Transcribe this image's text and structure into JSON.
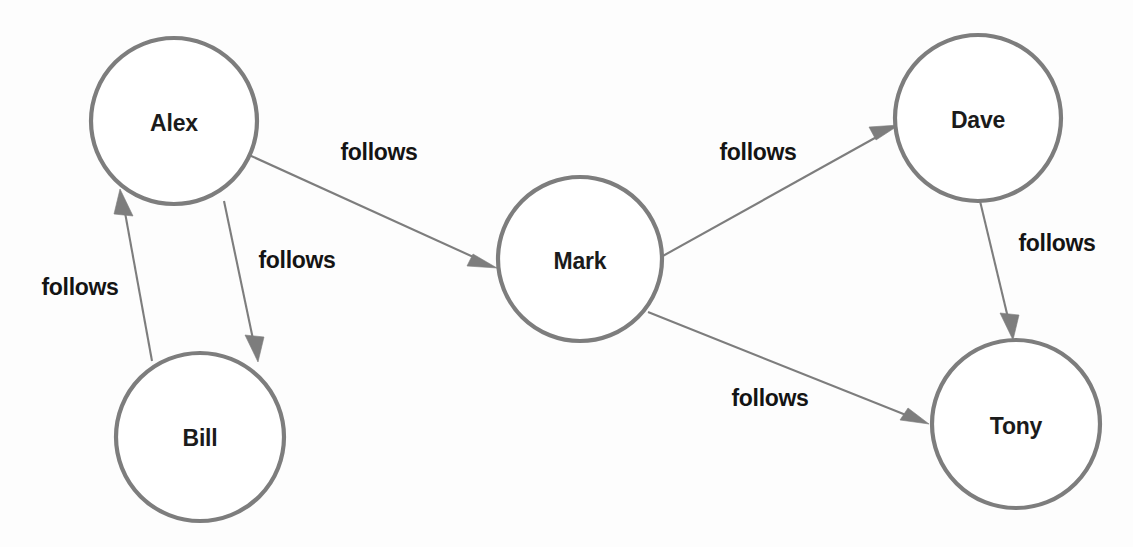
{
  "diagram": {
    "type": "directed-graph",
    "width": 1133,
    "height": 547,
    "background_color": "#fdfdfd",
    "node_stroke_color": "#7d7d7d",
    "node_fill_color": "#ffffff",
    "edge_stroke_color": "#7d7d7d",
    "label_color": "#141414",
    "nodes": [
      {
        "id": "alex",
        "label": "Alex",
        "cx": 174,
        "cy": 121,
        "r": 83
      },
      {
        "id": "bill",
        "label": "Bill",
        "cx": 200,
        "cy": 437,
        "r": 84
      },
      {
        "id": "mark",
        "label": "Mark",
        "cx": 580,
        "cy": 259,
        "r": 82
      },
      {
        "id": "dave",
        "label": "Dave",
        "cx": 978,
        "cy": 118,
        "r": 83
      },
      {
        "id": "tony",
        "label": "Tony",
        "cx": 1016,
        "cy": 424,
        "r": 84
      }
    ],
    "edges": [
      {
        "id": "alex-mark",
        "source": "alex",
        "target": "mark",
        "label": "follows",
        "x1": 249,
        "y1": 155,
        "x2": 497,
        "y2": 268,
        "label_x": 379,
        "label_y": 152
      },
      {
        "id": "alex-bill",
        "source": "alex",
        "target": "bill",
        "label": "follows",
        "x1": 224,
        "y1": 201,
        "x2": 258,
        "y2": 360,
        "label_x": 297,
        "label_y": 260
      },
      {
        "id": "bill-alex",
        "source": "bill",
        "target": "alex",
        "label": "follows",
        "x1": 152,
        "y1": 361,
        "x2": 120,
        "y2": 189,
        "label_x": 80,
        "label_y": 287
      },
      {
        "id": "mark-dave",
        "source": "mark",
        "target": "dave",
        "label": "follows",
        "x1": 661,
        "y1": 257,
        "x2": 899,
        "y2": 125,
        "label_x": 758,
        "label_y": 152
      },
      {
        "id": "mark-tony",
        "source": "mark",
        "target": "tony",
        "label": "follows",
        "x1": 648,
        "y1": 312,
        "x2": 929,
        "y2": 424,
        "label_x": 770,
        "label_y": 398
      },
      {
        "id": "dave-tony",
        "source": "dave",
        "target": "tony",
        "label": "follows",
        "x1": 980,
        "y1": 201,
        "x2": 1013,
        "y2": 338,
        "label_x": 1057,
        "label_y": 243
      }
    ]
  }
}
